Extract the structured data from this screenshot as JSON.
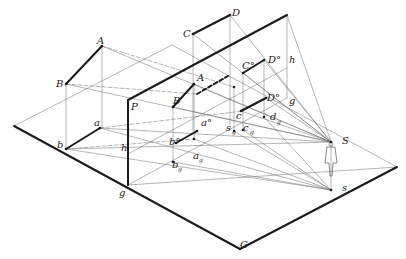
{
  "diagram": {
    "colors": {
      "thick": "#1a1a1a",
      "thin": "#6a6a6a",
      "bg": "#ffffff"
    },
    "ground_plane": {
      "corners": [
        [
          14,
          126
        ],
        [
          128,
          185
        ],
        [
          40,
          123
        ],
        [
          245,
          60
        ]
      ],
      "outline": [
        [
          14,
          126
        ],
        [
          130,
          187
        ],
        [
          238,
          248
        ],
        [
          396,
          167
        ],
        [
          270,
          98
        ],
        [
          245,
          60
        ]
      ],
      "front_edge": [
        [
          14,
          126
        ],
        [
          240,
          249
        ],
        [
          397,
          167
        ]
      ],
      "back_edges": [
        [
          [
            14,
            126
          ],
          [
            172,
            45
          ]
        ],
        [
          [
            172,
            45
          ],
          [
            397,
            167
          ]
        ]
      ]
    },
    "picture_plane": {
      "left_vertical": [
        [
          128,
          100
        ],
        [
          128,
          185
        ]
      ],
      "top_edge": [
        [
          128,
          100
        ],
        [
          287,
          15
        ]
      ],
      "right_vertical": [
        [
          287,
          15
        ],
        [
          287,
          40
        ]
      ],
      "label_P": "P",
      "label_g": "g",
      "label_h_left": "h",
      "label_h_right": "h",
      "label_g_right": "g",
      "label_G": "G"
    },
    "labels": [
      {
        "t": "A",
        "x": 97,
        "y": 44
      },
      {
        "t": "B",
        "x": 56,
        "y": 87
      },
      {
        "t": "a",
        "x": 94,
        "y": 126
      },
      {
        "t": "b",
        "x": 57,
        "y": 148
      },
      {
        "t": "P",
        "x": 131,
        "y": 110
      },
      {
        "t": "h",
        "x": 121,
        "y": 151
      },
      {
        "t": "g",
        "x": 119,
        "y": 196
      },
      {
        "t": "C",
        "x": 183,
        "y": 37
      },
      {
        "t": "D",
        "x": 232,
        "y": 16
      },
      {
        "t": "A",
        "x": 197,
        "y": 81
      },
      {
        "t": "B",
        "x": 173,
        "y": 104
      },
      {
        "t": "a°",
        "x": 201,
        "y": 126
      },
      {
        "t": "b°",
        "x": 169,
        "y": 145
      },
      {
        "t": "C°",
        "x": 242,
        "y": 69
      },
      {
        "t": "D°",
        "x": 268,
        "y": 63
      },
      {
        "t": "h",
        "x": 289,
        "y": 63
      },
      {
        "t": "D°",
        "x": 267,
        "y": 101
      },
      {
        "t": "g",
        "x": 289,
        "y": 104
      },
      {
        "t": "c",
        "x": 236,
        "y": 119
      },
      {
        "t": "d",
        "x": 270,
        "y": 120
      },
      {
        "t": "s",
        "x": 226,
        "y": 131
      },
      {
        "t": "c",
        "x": 243,
        "y": 131
      },
      {
        "t": "a",
        "x": 193,
        "y": 159
      },
      {
        "t": "b",
        "x": 172,
        "y": 168
      },
      {
        "t": "S",
        "x": 342,
        "y": 144
      },
      {
        "t": "s",
        "x": 342,
        "y": 191
      },
      {
        "t": "G",
        "x": 240,
        "y": 248
      }
    ],
    "subscript_g_labels": [
      {
        "x": 277,
        "y": 124
      },
      {
        "x": 232,
        "y": 134
      },
      {
        "x": 250,
        "y": 134
      },
      {
        "x": 199,
        "y": 162
      },
      {
        "x": 178,
        "y": 171
      }
    ],
    "thick_segments": [
      [
        [
          102,
          46
        ],
        [
          66,
          84
        ]
      ],
      [
        [
          100,
          128
        ],
        [
          66,
          149
        ]
      ],
      [
        [
          193,
          34
        ],
        [
          230,
          15
        ]
      ],
      [
        [
          243,
          73
        ],
        [
          264,
          60
        ]
      ],
      [
        [
          241,
          111
        ],
        [
          266,
          98
        ]
      ],
      [
        [
          173,
          107
        ],
        [
          194,
          84
        ]
      ],
      [
        [
          176,
          143
        ],
        [
          197,
          131
        ]
      ],
      [
        [
          128,
          100
        ],
        [
          287,
          15
        ]
      ],
      [
        [
          128,
          100
        ],
        [
          128,
          185
        ]
      ],
      [
        [
          14,
          126
        ],
        [
          240,
          249
        ]
      ],
      [
        [
          240,
          249
        ],
        [
          397,
          167
        ]
      ]
    ],
    "dashed_thick": [
      [
        [
          197,
          94
        ],
        [
          228,
          76
        ]
      ]
    ],
    "thin_segments": [
      [
        [
          102,
          46
        ],
        [
          102,
          128
        ]
      ],
      [
        [
          66,
          84
        ],
        [
          66,
          149
        ]
      ],
      [
        [
          102,
          46
        ],
        [
          331,
          142
        ]
      ],
      [
        [
          66,
          84
        ],
        [
          331,
          142
        ]
      ],
      [
        [
          100,
          128
        ],
        [
          331,
          142
        ]
      ],
      [
        [
          66,
          149
        ],
        [
          331,
          142
        ]
      ],
      [
        [
          100,
          128
        ],
        [
          331,
          190
        ]
      ],
      [
        [
          66,
          149
        ],
        [
          331,
          190
        ]
      ],
      [
        [
          193,
          34
        ],
        [
          193,
          131
        ]
      ],
      [
        [
          230,
          15
        ],
        [
          230,
          125
        ]
      ],
      [
        [
          193,
          34
        ],
        [
          331,
          142
        ]
      ],
      [
        [
          230,
          15
        ],
        [
          331,
          142
        ]
      ],
      [
        [
          287,
          15
        ],
        [
          287,
          98
        ]
      ],
      [
        [
          287,
          15
        ],
        [
          331,
          142
        ]
      ],
      [
        [
          128,
          185
        ],
        [
          397,
          167
        ]
      ],
      [
        [
          14,
          126
        ],
        [
          172,
          45
        ]
      ],
      [
        [
          172,
          45
        ],
        [
          397,
          167
        ]
      ],
      [
        [
          128,
          185
        ],
        [
          287,
          98
        ]
      ],
      [
        [
          194,
          84
        ],
        [
          194,
          139
        ]
      ],
      [
        [
          173,
          107
        ],
        [
          173,
          162
        ]
      ],
      [
        [
          243,
          73
        ],
        [
          243,
          130
        ]
      ],
      [
        [
          264,
          60
        ],
        [
          264,
          117
        ]
      ],
      [
        [
          234,
          87
        ],
        [
          234,
          131
        ]
      ],
      [
        [
          234,
          131
        ],
        [
          331,
          190
        ]
      ],
      [
        [
          243,
          130
        ],
        [
          331,
          190
        ]
      ],
      [
        [
          264,
          117
        ],
        [
          331,
          190
        ]
      ],
      [
        [
          194,
          139
        ],
        [
          331,
          190
        ]
      ],
      [
        [
          173,
          162
        ],
        [
          331,
          190
        ]
      ],
      [
        [
          241,
          111
        ],
        [
          331,
          142
        ]
      ],
      [
        [
          266,
          98
        ],
        [
          331,
          142
        ]
      ],
      [
        [
          243,
          73
        ],
        [
          331,
          142
        ]
      ],
      [
        [
          264,
          60
        ],
        [
          331,
          142
        ]
      ],
      [
        [
          173,
          107
        ],
        [
          331,
          142
        ]
      ],
      [
        [
          194,
          84
        ],
        [
          331,
          142
        ]
      ],
      [
        [
          128,
          154
        ],
        [
          287,
          68
        ]
      ],
      [
        [
          331,
          142
        ],
        [
          331,
          190
        ]
      ]
    ],
    "dashed_thin": [
      [
        [
          66,
          149
        ],
        [
          194,
          139
        ]
      ],
      [
        [
          100,
          128
        ],
        [
          243,
          111
        ]
      ],
      [
        [
          102,
          46
        ],
        [
          234,
          87
        ]
      ],
      [
        [
          66,
          84
        ],
        [
          197,
          94
        ]
      ]
    ],
    "points": [
      [
        102,
        46
      ],
      [
        66,
        84
      ],
      [
        100,
        128
      ],
      [
        66,
        149
      ],
      [
        193,
        34
      ],
      [
        230,
        15
      ],
      [
        243,
        73
      ],
      [
        264,
        60
      ],
      [
        241,
        111
      ],
      [
        266,
        98
      ],
      [
        173,
        107
      ],
      [
        194,
        84
      ],
      [
        176,
        143
      ],
      [
        197,
        131
      ],
      [
        194,
        139
      ],
      [
        173,
        162
      ],
      [
        234,
        87
      ],
      [
        264,
        117
      ],
      [
        234,
        131
      ],
      [
        243,
        130
      ],
      [
        331,
        142
      ],
      [
        331,
        190
      ]
    ],
    "observer": {
      "figure_label": "observer-figure",
      "eye": [
        331,
        142
      ],
      "foot": [
        331,
        190
      ]
    }
  }
}
